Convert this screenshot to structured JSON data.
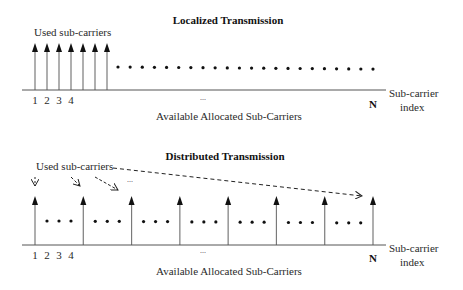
{
  "localized": {
    "title": "Localized Transmission",
    "used_label": "Used sub-carriers",
    "used_count": 7,
    "idle_dot_count": 22,
    "index_labels": [
      "1",
      "2",
      "3",
      "4"
    ],
    "ellipsis": "...",
    "last_index": "N",
    "axis_label_line1": "Sub-carrier",
    "axis_label_line2": "index",
    "caption": "Available Allocated Sub-Carriers"
  },
  "distributed": {
    "title": "Distributed Transmission",
    "used_label": "Used sub-carriers",
    "used_count": 8,
    "dots_between": 3,
    "index_labels": [
      "1",
      "2",
      "3",
      "4"
    ],
    "ellipsis": "...",
    "last_index": "N",
    "axis_label_line1": "Sub-carrier",
    "axis_label_line2": "index",
    "caption": "Available Allocated Sub-Carriers"
  },
  "colors": {
    "arrow": "#7a7a7a",
    "arrowhead": "#111111",
    "axis": "#555555",
    "dot": "#111111"
  }
}
